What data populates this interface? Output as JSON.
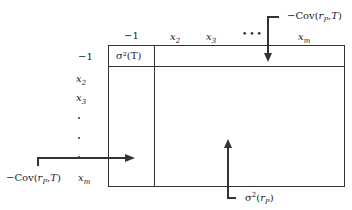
{
  "matrix": {
    "column_headers": [
      "−1",
      "x2",
      "x3",
      "•••",
      "xm"
    ],
    "row_headers": [
      "−1",
      "x2",
      "x3",
      "·",
      "·",
      "·",
      "xm"
    ],
    "top_left_cell": "σ²(T)"
  },
  "annotations": {
    "top_right": "−Cov(rP,T)",
    "bottom_left": "−Cov(rP,T)",
    "bottom_center": "σ²(rP)"
  }
}
